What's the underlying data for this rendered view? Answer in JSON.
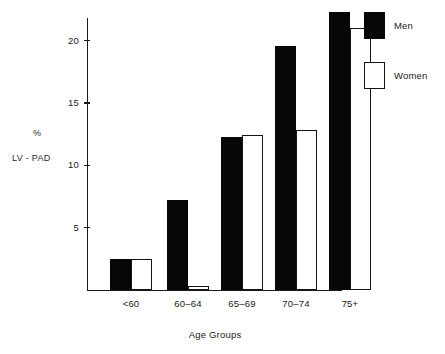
{
  "chart_data": {
    "type": "bar",
    "title": "",
    "xlabel": "Age Groups",
    "ylabel": "% LV - PAD",
    "ylabel_lines": [
      "%",
      "LV - PAD"
    ],
    "categories": [
      "<60",
      "60–64",
      "65–69",
      "70–74",
      "75+"
    ],
    "series": [
      {
        "name": "Men",
        "values": [
          2.5,
          7.2,
          12.3,
          19.6,
          22.3
        ]
      },
      {
        "name": "Women",
        "values": [
          2.5,
          0.3,
          12.4,
          12.8,
          21.0
        ]
      }
    ],
    "ylim": [
      0,
      22.5
    ],
    "yticks": [
      5,
      10,
      15,
      20
    ],
    "ytick_labels": [
      "5",
      "10",
      "15",
      "20"
    ],
    "grid": false,
    "legend_position": "top-right",
    "colors": {
      "men": "#070707",
      "women": "#ffffff",
      "outline": "#141414",
      "axis": "#1a1a1a",
      "background": "#ffffff"
    }
  },
  "legend": {
    "entries": [
      {
        "label": "Men",
        "swatch": "filled-black-square"
      },
      {
        "label": "Women",
        "swatch": "open-white-square"
      }
    ]
  }
}
